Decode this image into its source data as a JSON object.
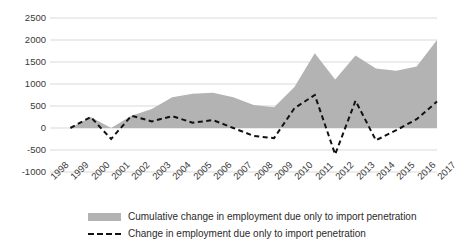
{
  "chart_data": {
    "type": "area",
    "title": "",
    "subtitle": "",
    "xlabel": "",
    "ylabel": "",
    "categories": [
      "1998",
      "1999",
      "2000",
      "2001",
      "2002",
      "2003",
      "2004",
      "2005",
      "2006",
      "2007",
      "2008",
      "2009",
      "2010",
      "2011",
      "2012",
      "2013",
      "2014",
      "2015",
      "2016",
      "2017"
    ],
    "ylim": [
      -1000,
      2500
    ],
    "ytick_labels": [
      "2500",
      "2000",
      "1500",
      "1000",
      "500",
      "0",
      "-500",
      "-1000"
    ],
    "ytick_values": [
      2500,
      2000,
      1500,
      1000,
      500,
      0,
      -500,
      -1000
    ],
    "grid": true,
    "legend_position": "bottom",
    "series": [
      {
        "name": "Cumulative change in employment due only to import penetration",
        "type": "area",
        "color": "#b3b3b3",
        "values": [
          null,
          0,
          250,
          0,
          280,
          430,
          700,
          780,
          800,
          700,
          520,
          470,
          930,
          1700,
          1100,
          1650,
          1350,
          1300,
          1400,
          2000
        ]
      },
      {
        "name": "Change in employment due only to import penetration",
        "type": "line",
        "style": "dashed",
        "color": "#111111",
        "values": [
          null,
          0,
          250,
          -250,
          280,
          150,
          270,
          120,
          180,
          0,
          -180,
          -230,
          450,
          750,
          -600,
          620,
          -280,
          -50,
          200,
          600
        ]
      }
    ]
  },
  "legend": {
    "items": [
      {
        "label": "Cumulative change in employment due only to import penetration",
        "marker": "area-swatch"
      },
      {
        "label": "Change in employment due only to import penetration",
        "marker": "dashed-line-swatch"
      }
    ]
  },
  "colors": {
    "area_fill": "#b3b3b3",
    "line": "#111111",
    "grid": "#d9d9d9",
    "text": "#3a3a3a",
    "background": "#ffffff"
  }
}
